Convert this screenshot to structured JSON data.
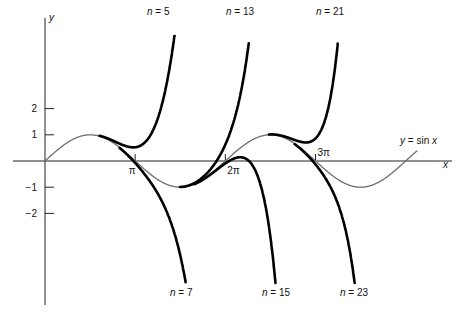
{
  "chart_data": {
    "type": "line",
    "title": "",
    "xlabel": "x",
    "ylabel": "y",
    "xlim": [
      0,
      13.2
    ],
    "ylim": [
      -4.65,
      4.77
    ],
    "grid": false,
    "x_ticks": [
      {
        "value": 3.14159,
        "label": "π"
      },
      {
        "value": 6.28319,
        "label": "2π"
      },
      {
        "value": 9.42478,
        "label": "3π"
      }
    ],
    "y_ticks": [
      {
        "value": 2,
        "label": "2"
      },
      {
        "value": 1,
        "label": "1"
      },
      {
        "value": -1,
        "label": "−1"
      },
      {
        "value": -2,
        "label": "−2"
      }
    ],
    "series": [
      {
        "name": "y = sin x",
        "label": "y = sin x",
        "kind": "sin",
        "x_range": [
          0,
          12.96
        ],
        "color": "#6e6e6e"
      },
      {
        "name": "n = 5",
        "label": "n = 5",
        "degree": 5,
        "x_range": [
          1.9,
          4.55
        ],
        "color": "#000000"
      },
      {
        "name": "n = 7",
        "label": "n = 7",
        "degree": 7,
        "x_range": [
          2.6,
          4.9
        ],
        "color": "#000000"
      },
      {
        "name": "n = 13",
        "label": "n = 13",
        "degree": 13,
        "x_range": [
          4.7,
          7.1
        ],
        "color": "#000000"
      },
      {
        "name": "n = 15",
        "label": "n = 15",
        "degree": 15,
        "x_range": [
          5.2,
          8.2
        ],
        "color": "#000000"
      },
      {
        "name": "n = 21",
        "label": "n = 21",
        "degree": 21,
        "x_range": [
          7.8,
          10.2
        ],
        "color": "#000000"
      },
      {
        "name": "n = 23",
        "label": "n = 23",
        "degree": 23,
        "x_range": [
          8.7,
          11.0
        ],
        "color": "#000000"
      }
    ],
    "annotations": [
      {
        "text": "n = 5",
        "x": 147,
        "y": 15
      },
      {
        "text": "n = 13",
        "x": 226,
        "y": 15
      },
      {
        "text": "n = 21",
        "x": 316,
        "y": 15
      },
      {
        "text": "n = 7",
        "x": 170,
        "y": 296
      },
      {
        "text": "n = 15",
        "x": 262,
        "y": 296
      },
      {
        "text": "n = 23",
        "x": 340,
        "y": 296
      },
      {
        "text": "y = sin x",
        "x": 400,
        "y": 144
      }
    ]
  }
}
